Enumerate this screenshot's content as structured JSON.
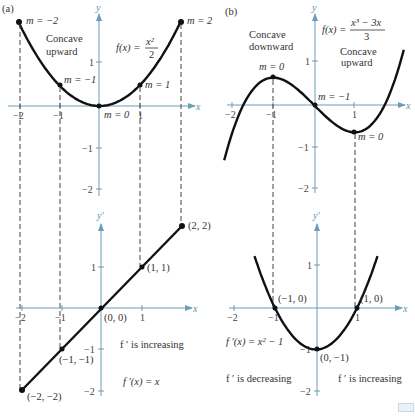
{
  "figure": {
    "colors": {
      "axis": "#6b9db5",
      "curve": "#111111",
      "dash": "#444444",
      "text": "#333333"
    },
    "panels": [
      {
        "id": "a",
        "label": "(a)",
        "top": {
          "function_label": "f(x) = x²/2",
          "func_lhs": "f(x) =",
          "func_num": "x²",
          "func_den": "2",
          "y_axis_name": "y",
          "x_axis_name": "x",
          "concavity_label_lines": [
            "Concave",
            "upward"
          ],
          "slope_labels": [
            "m = −2",
            "m = −1",
            "m = 0",
            "m = 1",
            "m = 2"
          ],
          "x_ticks": [
            "−2",
            "−1",
            "1"
          ],
          "y_ticks": [
            "1",
            "−1",
            "−2"
          ]
        },
        "bottom": {
          "function_label": "f ′(x) = x",
          "y_axis_name": "y′",
          "x_axis_name": "x",
          "behavior_label": "f ′ is increasing",
          "point_labels": [
            "(2, 2)",
            "(1, 1)",
            "(0, 0)",
            "(−1, −1)",
            "(−2, −2)"
          ],
          "x_ticks": [
            "−2",
            "−1",
            "1"
          ],
          "y_ticks": [
            "1",
            "−1",
            "−2"
          ]
        }
      },
      {
        "id": "b",
        "label": "(b)",
        "top": {
          "function_label": "f(x) = (x³ − 3x)/3",
          "func_lhs": "f(x) =",
          "func_num": "x³ − 3x",
          "func_den": "3",
          "y_axis_name": "y",
          "x_axis_name": "x",
          "concave_down_lines": [
            "Concave",
            "downward"
          ],
          "concave_up_lines": [
            "Concave",
            "upward"
          ],
          "slope_labels": [
            "m = 0",
            "m = −1",
            "m = 0"
          ],
          "x_ticks": [
            "−2",
            "−1",
            "1"
          ],
          "y_ticks": [
            "1",
            "−1",
            "−2"
          ]
        },
        "bottom": {
          "function_label": "f ′(x) = x² − 1",
          "y_axis_name": "y′",
          "x_axis_name": "x",
          "decreasing_label": "f ′ is decreasing",
          "increasing_label": "f ′ is increasing",
          "point_labels": [
            "(−1, 0)",
            "(1, 0)",
            "(0, −1)"
          ],
          "x_ticks": [
            "−2",
            "−1",
            "1"
          ],
          "y_ticks": [
            "1",
            "−1",
            "−2"
          ]
        }
      }
    ]
  }
}
